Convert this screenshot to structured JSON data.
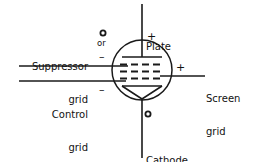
{
  "diagram": {
    "type": "pentode-vacuum-tube-schematic",
    "background_color": "#ffffff",
    "line_color": "#1a1a1a",
    "text_color": "#111111",
    "labels": {
      "suppressor_grid_line1": "Suppressor",
      "suppressor_grid_line2": "grid",
      "control_grid_line1": "Control",
      "control_grid_line2": "grid",
      "screen_grid_line1": "Screen",
      "screen_grid_line2": "grid",
      "plate": "Plate",
      "cathode": "Cathode",
      "or": "or"
    },
    "polarity_signs": {
      "plate": "+",
      "screen_grid": "+",
      "suppressor_grid": "–",
      "control_grid": "–"
    },
    "markers": {
      "suppressor_alt_connection": "open-circle",
      "cathode_heater_connection": "open-circle"
    },
    "envelope": {
      "shape": "circle",
      "center_x": 142,
      "center_y": 70,
      "radius": 30
    },
    "electrodes": [
      {
        "name": "plate",
        "shape": "horizontal-bar",
        "y": 57
      },
      {
        "name": "suppressor-grid",
        "shape": "dashed-line",
        "y": 64
      },
      {
        "name": "control-grid",
        "shape": "dashed-line",
        "y": 71
      },
      {
        "name": "screen-grid",
        "shape": "dashed-line",
        "y": 78
      },
      {
        "name": "cathode",
        "shape": "inverted-triangle",
        "y": 86
      }
    ],
    "leads": [
      {
        "name": "plate-lead",
        "direction": "up"
      },
      {
        "name": "cathode-lead",
        "direction": "down"
      },
      {
        "name": "suppressor-grid-lead",
        "direction": "left",
        "y": 66
      },
      {
        "name": "control-grid-lead",
        "direction": "left",
        "y": 81
      },
      {
        "name": "screen-grid-lead",
        "direction": "right",
        "y": 76
      }
    ]
  }
}
